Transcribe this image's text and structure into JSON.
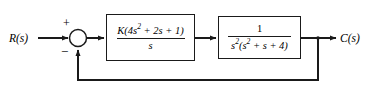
{
  "diagram": {
    "type": "control-system-block-diagram",
    "background_color": "#ffffff",
    "line_color": "#1a1a1a",
    "signals": {
      "input_label": "R(s)",
      "output_label": "C(s)"
    },
    "summing_junction": {
      "name": "summing-junction",
      "input_sign": "+",
      "feedback_sign": "−"
    },
    "blocks": [
      {
        "name": "controller",
        "numerator_prefix": "K(4",
        "numerator": "K(4s² + 2s + 1)",
        "numerator_parts": {
          "k_open": "K(4",
          "exp1": "2",
          "mid": " + 2",
          "s2": "s",
          "tail": " + 1)"
        },
        "denominator": "s"
      },
      {
        "name": "plant",
        "numerator": "1",
        "denominator": "s²(s² + s + 4)",
        "denominator_parts": {
          "s_first": "s",
          "exp_first": "2",
          "open": "(",
          "s_second": "s",
          "exp_second": "2",
          "tail": " + s + 4)"
        }
      }
    ],
    "feedback_path": {
      "name": "unity-feedback-path",
      "gain": "1"
    }
  }
}
